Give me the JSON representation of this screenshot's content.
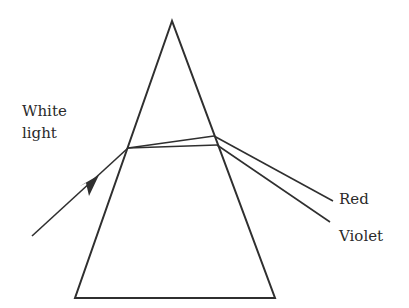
{
  "diagram": {
    "labels": {
      "incident": [
        "White",
        "light"
      ],
      "red": "Red",
      "violet": "Violet"
    },
    "colors": {
      "stroke": "#2f2f2f",
      "text": "#2a2a2a",
      "background": "#ffffff"
    },
    "prism": {
      "apex": [
        172,
        21
      ],
      "base_left": [
        75,
        298
      ],
      "base_right": [
        275,
        298
      ]
    },
    "rays": {
      "incident": {
        "from": [
          32,
          236
        ],
        "to": [
          128,
          148
        ]
      },
      "red_inside": {
        "from": [
          128,
          148
        ],
        "to": [
          214,
          136
        ]
      },
      "violet_inside": {
        "from": [
          128,
          148
        ],
        "to": [
          217,
          145
        ]
      },
      "red_out": {
        "from": [
          214,
          136
        ],
        "to": [
          333,
          201
        ]
      },
      "violet_out": {
        "from": [
          217,
          145
        ],
        "to": [
          330,
          222
        ]
      }
    }
  }
}
